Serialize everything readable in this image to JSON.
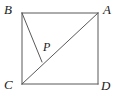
{
  "figure": {
    "kind": "geometry-diagram",
    "canvas": {
      "width": 120,
      "height": 97,
      "background": "#ffffff"
    },
    "stroke": {
      "color": "#595959",
      "width": 1
    },
    "square": {
      "name": "square-ABDC",
      "left": 22,
      "top": 13,
      "right": 98,
      "bottom": 84,
      "side_px": 76
    },
    "vertices": [
      {
        "id": "B",
        "label": "B",
        "x": 22,
        "y": 13,
        "label_x": 4,
        "label_y": 3
      },
      {
        "id": "A",
        "label": "A",
        "x": 98,
        "y": 13,
        "label_x": 103,
        "label_y": 3
      },
      {
        "id": "C",
        "label": "C",
        "x": 22,
        "y": 84,
        "label_x": 4,
        "label_y": 78
      },
      {
        "id": "D",
        "label": "D",
        "x": 98,
        "y": 84,
        "label_x": 101,
        "label_y": 79
      }
    ],
    "points": [
      {
        "id": "P",
        "label": "P",
        "x": 42,
        "y": 62,
        "label_x": 43,
        "label_y": 41
      }
    ],
    "segments": [
      {
        "name": "side-BA",
        "from": "B",
        "to": "A",
        "x1": 22,
        "y1": 13,
        "x2": 98,
        "y2": 13
      },
      {
        "name": "side-AD",
        "from": "A",
        "to": "D",
        "x1": 98,
        "y1": 13,
        "x2": 98,
        "y2": 84
      },
      {
        "name": "side-DC",
        "from": "D",
        "to": "C",
        "x1": 98,
        "y1": 84,
        "x2": 22,
        "y2": 84
      },
      {
        "name": "side-CB",
        "from": "C",
        "to": "B",
        "x1": 22,
        "y1": 84,
        "x2": 22,
        "y2": 13
      },
      {
        "name": "diagonal-CA",
        "from": "C",
        "to": "A",
        "x1": 22,
        "y1": 84,
        "x2": 98,
        "y2": 13
      },
      {
        "name": "segment-BP",
        "from": "B",
        "to": "P",
        "x1": 22,
        "y1": 13,
        "x2": 42,
        "y2": 62
      }
    ],
    "labels": {
      "A": "A",
      "B": "B",
      "C": "C",
      "D": "D",
      "P": "P"
    }
  }
}
